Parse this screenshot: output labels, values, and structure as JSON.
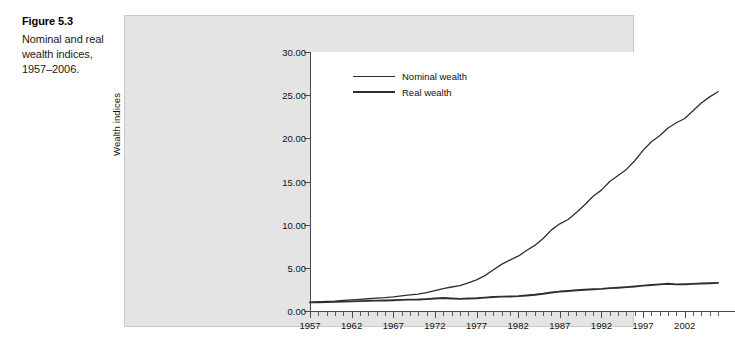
{
  "figure": {
    "number_label": "Figure 5.3",
    "caption": "Nominal and real wealth indices, 1957–2006."
  },
  "colors": {
    "panel_background": "#e4e4e4",
    "plot_background": "#ffffff",
    "axis": "#4a4a4a",
    "nominal_line": "#2e2e2e",
    "real_line": "#2e2e2e",
    "text": "#111111"
  },
  "chart_data": {
    "type": "line",
    "title": "",
    "xlabel": "",
    "ylabel": "Wealth indices",
    "xlim": [
      1957,
      2006
    ],
    "ylim": [
      0.0,
      30.0
    ],
    "ytick_labels": [
      "0.00",
      "5.00",
      "10.00",
      "15.00",
      "20.00",
      "25.00",
      "30.00"
    ],
    "ytick_values": [
      0.0,
      5.0,
      10.0,
      15.0,
      20.0,
      25.0,
      30.0
    ],
    "xtick_labels": [
      "1957",
      "1962",
      "1967",
      "1972",
      "1977",
      "1982",
      "1987",
      "1992",
      "1997",
      "2002"
    ],
    "xtick_values": [
      1957,
      1962,
      1967,
      1972,
      1977,
      1982,
      1987,
      1992,
      1997,
      2002
    ],
    "minor_xtick_step": 1,
    "grid": false,
    "legend_position": "upper-left-inside",
    "x": [
      1957,
      1958,
      1959,
      1960,
      1961,
      1962,
      1963,
      1964,
      1965,
      1966,
      1967,
      1968,
      1969,
      1970,
      1971,
      1972,
      1973,
      1974,
      1975,
      1976,
      1977,
      1978,
      1979,
      1980,
      1981,
      1982,
      1983,
      1984,
      1985,
      1986,
      1987,
      1988,
      1989,
      1990,
      1991,
      1992,
      1993,
      1994,
      1995,
      1996,
      1997,
      1998,
      1999,
      2000,
      2001,
      2002,
      2003,
      2004,
      2005,
      2006
    ],
    "series": [
      {
        "name": "Nominal wealth",
        "values": [
          1.0,
          1.05,
          1.12,
          1.15,
          1.22,
          1.28,
          1.34,
          1.42,
          1.5,
          1.55,
          1.63,
          1.76,
          1.86,
          1.95,
          2.12,
          2.35,
          2.6,
          2.78,
          2.95,
          3.25,
          3.6,
          4.1,
          4.75,
          5.4,
          5.9,
          6.35,
          7.0,
          7.6,
          8.4,
          9.4,
          10.1,
          10.6,
          11.4,
          12.3,
          13.3,
          14.0,
          15.0,
          15.7,
          16.4,
          17.4,
          18.6,
          19.6,
          20.3,
          21.2,
          21.8,
          22.3,
          23.2,
          24.1,
          24.8,
          25.4
        ]
      },
      {
        "name": "Real wealth",
        "values": [
          1.0,
          1.02,
          1.05,
          1.06,
          1.09,
          1.11,
          1.14,
          1.17,
          1.2,
          1.21,
          1.24,
          1.29,
          1.32,
          1.33,
          1.38,
          1.45,
          1.5,
          1.45,
          1.4,
          1.45,
          1.48,
          1.55,
          1.63,
          1.66,
          1.68,
          1.72,
          1.8,
          1.88,
          2.0,
          2.15,
          2.25,
          2.32,
          2.4,
          2.46,
          2.52,
          2.56,
          2.65,
          2.7,
          2.76,
          2.84,
          2.94,
          3.02,
          3.08,
          3.15,
          3.08,
          3.1,
          3.14,
          3.18,
          3.22,
          3.26
        ]
      }
    ]
  }
}
